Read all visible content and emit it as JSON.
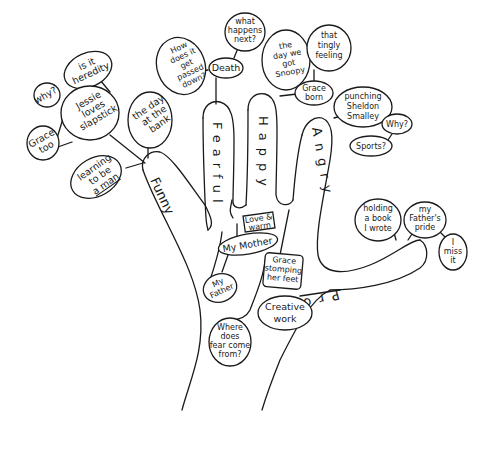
{
  "diagram": {
    "type": "hand-mind-map",
    "fingers": {
      "pinky": "Funny",
      "ring": "Fearful",
      "middle": "Happy",
      "index": "Angry",
      "thumb": "Proud"
    },
    "palm": {
      "center": "My Mother",
      "box": [
        "Love &",
        "warm"
      ],
      "lower": [
        "My",
        "Father"
      ],
      "bottom": [
        "Where",
        "does",
        "fear come",
        "from?"
      ],
      "angry_box": [
        "Grace",
        "stomping",
        "her feet"
      ]
    },
    "funny_branch": {
      "jessie": [
        "Jessie",
        "loves",
        "slapstick"
      ],
      "grace_too": [
        "Grace",
        "too"
      ],
      "why": [
        "why?"
      ],
      "heredity": [
        "is it",
        "heredity"
      ],
      "bank": [
        "the day",
        "at the",
        "bank"
      ],
      "man": [
        "learning",
        "to be",
        "a man"
      ]
    },
    "fearful_branch": {
      "passed": [
        "How",
        "does it",
        "get",
        "passed",
        "down?"
      ],
      "death": [
        "Death"
      ],
      "next": [
        "what",
        "happens",
        "next?"
      ]
    },
    "happy_branch": {
      "snoopy": [
        "the",
        "day we",
        "got",
        "Snoopy"
      ],
      "tingly": [
        "that",
        "tingly",
        "feeling"
      ],
      "grace_born": [
        "Grace",
        "born"
      ]
    },
    "angry_branch": {
      "punching": [
        "punching",
        "Sheldon",
        "Smalley"
      ],
      "why": [
        "Why?"
      ],
      "sports": [
        "Sports?"
      ]
    },
    "proud_branch": {
      "book": [
        "holding",
        "a book",
        "I wrote"
      ],
      "pride": [
        "my",
        "Father's",
        "pride"
      ],
      "miss": [
        "I",
        "miss",
        "it"
      ],
      "creative": [
        "Creative",
        "work"
      ]
    }
  }
}
